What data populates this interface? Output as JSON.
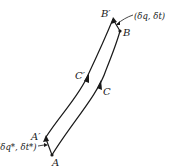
{
  "diagram": {
    "curves": [
      {
        "id": "C",
        "label": "C",
        "from": "A",
        "to": "B"
      },
      {
        "id": "C-prime",
        "label": "C′",
        "from": "A′",
        "to": "B′"
      }
    ],
    "points": {
      "A": "A",
      "B": "B",
      "A_prime": "A′",
      "B_prime": "B′"
    },
    "variations": {
      "start": "(δq*, δt*)",
      "end": "(δq, δt)"
    },
    "colors": {
      "ink": "#1a1a1a",
      "background": "#ffffff"
    }
  }
}
